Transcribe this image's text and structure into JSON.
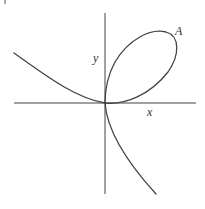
{
  "diagram": {
    "type": "curve-plot",
    "labels": {
      "x_axis": "x",
      "y_axis": "y",
      "point": "A"
    },
    "colors": {
      "line": "#444444",
      "background": "#ffffff",
      "text": "#333333"
    },
    "axes": {
      "origin_px": [
        105,
        103
      ],
      "x_axis_px": [
        14,
        196
      ],
      "y_axis_px": [
        13,
        194
      ]
    }
  }
}
